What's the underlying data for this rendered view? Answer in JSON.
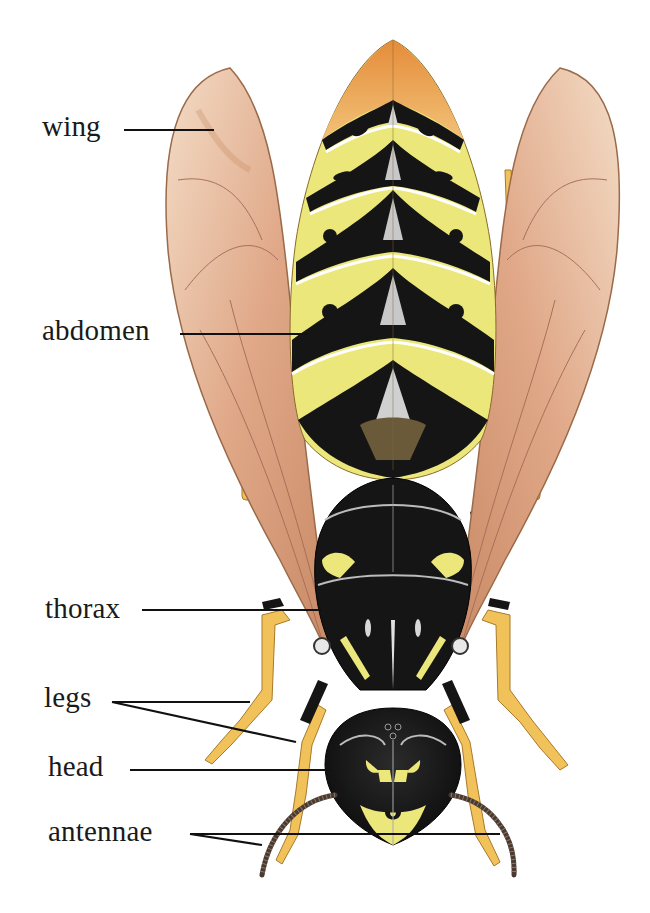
{
  "diagram": {
    "labels": [
      {
        "id": "wing",
        "text": "wing",
        "x": 42,
        "y": 112
      },
      {
        "id": "abdomen",
        "text": "abdomen",
        "x": 42,
        "y": 316
      },
      {
        "id": "thorax",
        "text": "thorax",
        "x": 45,
        "y": 594
      },
      {
        "id": "legs",
        "text": "legs",
        "x": 44,
        "y": 685
      },
      {
        "id": "head",
        "text": "head",
        "x": 48,
        "y": 753
      },
      {
        "id": "antennae",
        "text": "antennae",
        "x": 48,
        "y": 818
      }
    ],
    "colors": {
      "background": "#ffffff",
      "label_text": "#1a1a1a",
      "leader_line": "#111111",
      "abdomen_yellow": "#ece77a",
      "abdomen_tip_orange": "#e9a24e",
      "body_black": "#151515",
      "wing_tan": "#dca482",
      "leg_yellow": "#f2c25a",
      "antenna_brown": "#4a3a30"
    }
  }
}
